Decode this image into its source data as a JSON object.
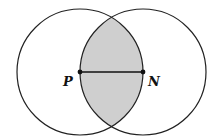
{
  "diagram": {
    "points": {
      "P": {
        "label": "P",
        "x": 80,
        "y": 72
      },
      "N": {
        "label": "N",
        "x": 143,
        "y": 72
      }
    },
    "circles": [
      {
        "center": "P",
        "radius": 63
      },
      {
        "center": "N",
        "radius": 63
      }
    ],
    "colors": {
      "stroke": "#222222",
      "shade": "#cfcfcf",
      "background": "#ffffff"
    }
  }
}
